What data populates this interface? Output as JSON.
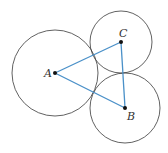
{
  "diagram": {
    "colors": {
      "circle": "#3a3a3a",
      "segment": "#4a90c8",
      "point": "#111111",
      "label": "#333333"
    },
    "points": [
      {
        "id": "A",
        "label": "A",
        "x": 55,
        "y": 73
      },
      {
        "id": "B",
        "label": "B",
        "x": 125,
        "y": 108
      },
      {
        "id": "C",
        "label": "C",
        "x": 121,
        "y": 42
      }
    ],
    "circles": [
      {
        "center": "A",
        "r": 43
      },
      {
        "center": "B",
        "r": 35
      },
      {
        "center": "C",
        "r": 31
      }
    ],
    "segments": [
      [
        "A",
        "C"
      ],
      [
        "C",
        "B"
      ],
      [
        "A",
        "B"
      ]
    ]
  }
}
